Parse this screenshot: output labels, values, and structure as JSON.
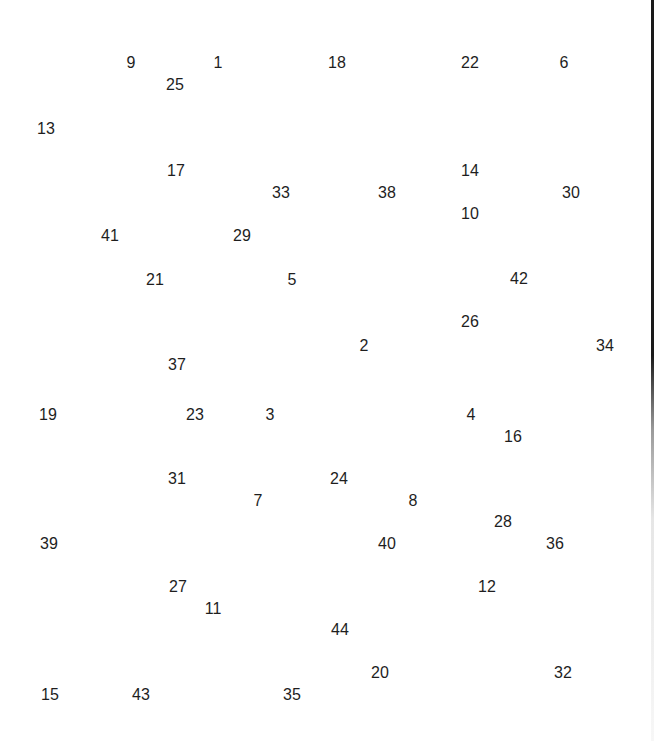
{
  "puzzle": {
    "type": "connect-the-dots",
    "labels": [
      {
        "n": "1",
        "x": 218,
        "y": 63
      },
      {
        "n": "2",
        "x": 364,
        "y": 346
      },
      {
        "n": "3",
        "x": 270,
        "y": 415
      },
      {
        "n": "4",
        "x": 471,
        "y": 415
      },
      {
        "n": "5",
        "x": 292,
        "y": 280
      },
      {
        "n": "6",
        "x": 564,
        "y": 63
      },
      {
        "n": "7",
        "x": 258,
        "y": 501
      },
      {
        "n": "8",
        "x": 413,
        "y": 501
      },
      {
        "n": "9",
        "x": 131,
        "y": 63
      },
      {
        "n": "10",
        "x": 470,
        "y": 214
      },
      {
        "n": "11",
        "x": 213,
        "y": 609
      },
      {
        "n": "12",
        "x": 487,
        "y": 587
      },
      {
        "n": "13",
        "x": 46,
        "y": 129
      },
      {
        "n": "14",
        "x": 470,
        "y": 171
      },
      {
        "n": "15",
        "x": 50,
        "y": 695
      },
      {
        "n": "16",
        "x": 513,
        "y": 437
      },
      {
        "n": "17",
        "x": 176,
        "y": 171
      },
      {
        "n": "18",
        "x": 337,
        "y": 63
      },
      {
        "n": "19",
        "x": 48,
        "y": 415
      },
      {
        "n": "20",
        "x": 380,
        "y": 673
      },
      {
        "n": "21",
        "x": 155,
        "y": 280
      },
      {
        "n": "22",
        "x": 470,
        "y": 63
      },
      {
        "n": "23",
        "x": 195,
        "y": 415
      },
      {
        "n": "24",
        "x": 339,
        "y": 479
      },
      {
        "n": "25",
        "x": 175,
        "y": 85
      },
      {
        "n": "26",
        "x": 470,
        "y": 322
      },
      {
        "n": "27",
        "x": 178,
        "y": 587
      },
      {
        "n": "28",
        "x": 503,
        "y": 522
      },
      {
        "n": "29",
        "x": 242,
        "y": 236
      },
      {
        "n": "30",
        "x": 571,
        "y": 193
      },
      {
        "n": "31",
        "x": 177,
        "y": 479
      },
      {
        "n": "32",
        "x": 563,
        "y": 673
      },
      {
        "n": "33",
        "x": 281,
        "y": 193
      },
      {
        "n": "34",
        "x": 605,
        "y": 346
      },
      {
        "n": "35",
        "x": 292,
        "y": 695
      },
      {
        "n": "36",
        "x": 555,
        "y": 544
      },
      {
        "n": "37",
        "x": 177,
        "y": 365
      },
      {
        "n": "38",
        "x": 387,
        "y": 193
      },
      {
        "n": "39",
        "x": 49,
        "y": 544
      },
      {
        "n": "40",
        "x": 387,
        "y": 544
      },
      {
        "n": "41",
        "x": 110,
        "y": 236
      },
      {
        "n": "42",
        "x": 519,
        "y": 279
      },
      {
        "n": "43",
        "x": 141,
        "y": 695
      },
      {
        "n": "44",
        "x": 340,
        "y": 630
      }
    ]
  }
}
